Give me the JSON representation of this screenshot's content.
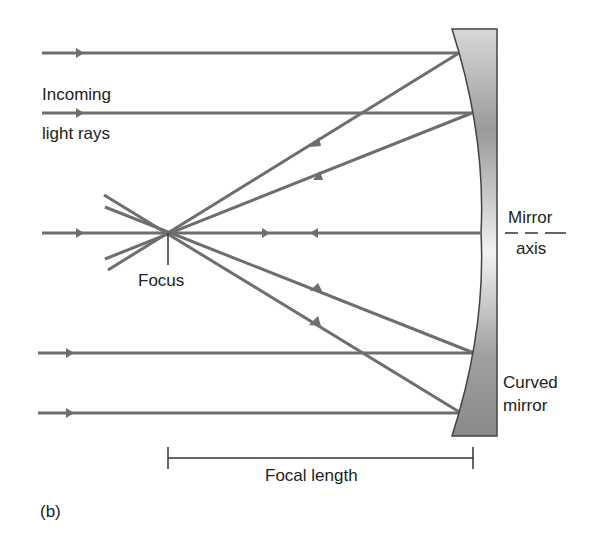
{
  "figure": {
    "panel_label": "(b)",
    "labels": {
      "incoming_line1": "Incoming",
      "incoming_line2": "light rays",
      "focus": "Focus",
      "mirror_axis_line1": "Mirror",
      "mirror_axis_line2": "axis",
      "curved_mirror_line1": "Curved",
      "curved_mirror_line2": "mirror",
      "focal_length": "Focal length"
    },
    "colors": {
      "ray": "#6e6e6e",
      "mirror_dark": "#8a8a8a",
      "mirror_light": "#f0f0f0",
      "outline": "#444444",
      "text": "#222222"
    }
  }
}
